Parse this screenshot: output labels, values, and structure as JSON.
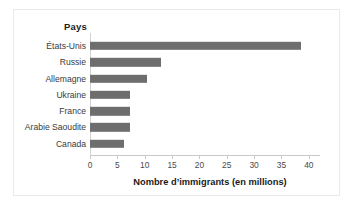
{
  "chart_data": {
    "type": "bar",
    "orientation": "horizontal",
    "title": "",
    "category_header": "Pays",
    "xlabel": "Nombre d’immigrants (en millions)",
    "ylabel": "",
    "categories": [
      "États-Unis",
      "Russie",
      "Allemagne",
      "Ukraine",
      "France",
      "Arabie Saoudite",
      "Canada"
    ],
    "values": [
      38.5,
      12.9,
      10.5,
      7.3,
      7.3,
      7.3,
      6.2
    ],
    "xlim": [
      0,
      40
    ],
    "xticks": [
      0,
      5,
      10,
      15,
      20,
      25,
      30,
      35,
      40
    ],
    "xtick_labels": [
      "0",
      "5",
      "10",
      "15",
      "20",
      "25",
      "30",
      "35",
      "40"
    ],
    "grid": false,
    "legend": false,
    "bar_color": "#6e6e6e",
    "axis_color": "#c9c9c9",
    "frame_color": "#e9e9e9",
    "text_color": "#3a3a3a"
  }
}
